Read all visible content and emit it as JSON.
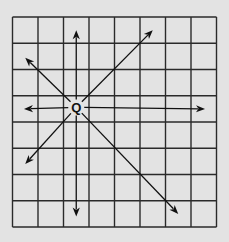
{
  "diagram": {
    "title": "",
    "grid": {
      "columns": 8,
      "rows": 8
    },
    "origin": {
      "label": "Q",
      "cell_col": 2.5,
      "cell_row": 3.5
    },
    "arrows": [
      {
        "name": "arrow-up",
        "direction": "up",
        "to_col": 2.5,
        "to_row": 0.5
      },
      {
        "name": "arrow-down",
        "direction": "down",
        "to_col": 2.5,
        "to_row": 7.6
      },
      {
        "name": "arrow-left",
        "direction": "left",
        "to_col": 0.45,
        "to_row": 3.5
      },
      {
        "name": "arrow-right",
        "direction": "right",
        "to_col": 7.55,
        "to_row": 3.5
      },
      {
        "name": "arrow-up-right",
        "direction": "up-right",
        "to_col": 5.5,
        "to_row": 0.5
      },
      {
        "name": "arrow-up-left",
        "direction": "up-left",
        "to_col": 0.5,
        "to_row": 1.55
      },
      {
        "name": "arrow-down-left",
        "direction": "down-left",
        "to_col": 0.5,
        "to_row": 5.6
      },
      {
        "name": "arrow-down-right",
        "direction": "down-right",
        "to_col": 6.5,
        "to_row": 7.5
      }
    ],
    "colors": {
      "background": "#e3e3e3",
      "lines": "#2a2a2a",
      "arrows": "#111111"
    }
  }
}
